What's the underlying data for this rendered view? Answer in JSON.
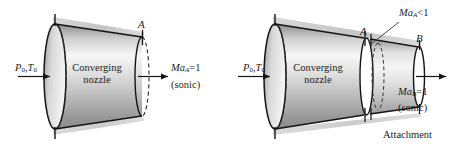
{
  "figure": {
    "type": "engineering-diagram",
    "panels": [
      {
        "id": "left",
        "name": "converging-nozzle-alone",
        "inlet_label": "P",
        "inlet_sub_1": "0",
        "inlet_comma": ",",
        "inlet_label_2": "T",
        "inlet_sub_2": "0",
        "body_line_1": "Converging",
        "body_line_2": "nozzle",
        "station_label": "A",
        "exit_mach": "Ma",
        "exit_mach_sub": "A",
        "exit_mach_value": "=1",
        "exit_note": "(sonic)"
      },
      {
        "id": "right",
        "name": "converging-nozzle-with-attachment",
        "inlet_label": "P",
        "inlet_sub_1": "0",
        "inlet_comma": ",",
        "inlet_label_2": "T",
        "inlet_sub_2": "0",
        "body_line_1": "Converging",
        "body_line_2": "nozzle",
        "station_label_a": "A",
        "station_label_b": "B",
        "callout_mach": "Ma",
        "callout_mach_sub": "A",
        "callout_mach_value": "<1",
        "exit_mach": "Ma",
        "exit_mach_sub": "B",
        "exit_mach_value": "=1",
        "exit_note": "(sonic)",
        "attachment_label": "Attachment"
      }
    ],
    "colors": {
      "outline": "#141414",
      "shade_light": "#f2f2f2",
      "shade_mid": "#b9b9b9",
      "shade_dark": "#7e7e7e",
      "shadow_strip": "#c9c9c9",
      "background": "#ffffff",
      "dashed": "#2b2b2b"
    }
  }
}
